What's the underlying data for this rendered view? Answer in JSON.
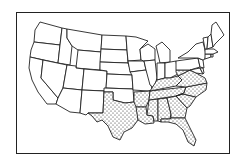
{
  "map": {
    "title": "",
    "region": "Contiguous United States",
    "style": "black outline, state boundaries",
    "colors": {
      "outline": "#222222",
      "background": "#ffffff",
      "stipple": "#222222"
    },
    "highlighted_pattern": "dot-stipple",
    "highlighted_states": [
      "Texas",
      "Arkansas",
      "Louisiana",
      "Mississippi",
      "Alabama",
      "Georgia",
      "Florida",
      "South Carolina",
      "North Carolina",
      "Tennessee",
      "Kentucky",
      "Virginia",
      "West Virginia"
    ],
    "unhighlighted_states": [
      "Washington",
      "Oregon",
      "California",
      "Idaho",
      "Nevada",
      "Montana",
      "Wyoming",
      "Utah",
      "Arizona",
      "Colorado",
      "New Mexico",
      "North Dakota",
      "South Dakota",
      "Nebraska",
      "Kansas",
      "Oklahoma",
      "Minnesota",
      "Iowa",
      "Missouri",
      "Wisconsin",
      "Illinois",
      "Michigan",
      "Indiana",
      "Ohio",
      "Pennsylvania",
      "New York",
      "Maryland",
      "Delaware",
      "New Jersey",
      "Connecticut",
      "Rhode Island",
      "Massachusetts",
      "Vermont",
      "New Hampshire",
      "Maine"
    ]
  }
}
